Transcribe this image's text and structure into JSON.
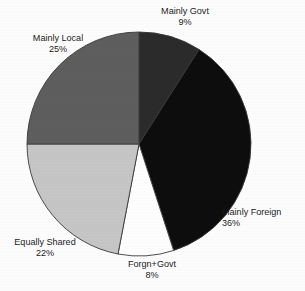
{
  "chart_data": {
    "type": "pie",
    "title": "",
    "subtitle": "",
    "xlabel": "",
    "ylabel": "",
    "grid": false,
    "legend_position": "none",
    "labels_position": "outside",
    "total_percent": 100,
    "start_angle_deg": 0,
    "direction": "clockwise",
    "categories": [
      "Mainly Govt",
      "Mainly Foreign",
      "Forgn+Govt",
      "Equally Shared",
      "Mainly Local"
    ],
    "values": [
      9,
      36,
      8,
      22,
      25
    ],
    "value_suffix": "%",
    "slices": [
      {
        "name": "Mainly Govt",
        "value": 9,
        "value_text": "9%",
        "color": "#2b2b2b",
        "start_deg": 0,
        "end_deg": 32.4
      },
      {
        "name": "Mainly Foreign",
        "value": 36,
        "value_text": "36%",
        "color": "#0d0d0d",
        "start_deg": 32.4,
        "end_deg": 162
      },
      {
        "name": "Forgn+Govt",
        "value": 8,
        "value_text": "8%",
        "color": "#fefefe",
        "start_deg": 162,
        "end_deg": 190.8
      },
      {
        "name": "Equally Shared",
        "value": 22,
        "value_text": "22%",
        "color": "#c6c6c6",
        "start_deg": 190.8,
        "end_deg": 270
      },
      {
        "name": "Mainly Local",
        "value": 25,
        "value_text": "25%",
        "color": "#5e5e5e",
        "start_deg": 270,
        "end_deg": 360
      }
    ],
    "geometry": {
      "center_x": 139,
      "center_y": 144,
      "radius": 112,
      "outline_color": "#3a3a3a",
      "outline_width": 0.9,
      "background": "#fdfdfd"
    }
  }
}
